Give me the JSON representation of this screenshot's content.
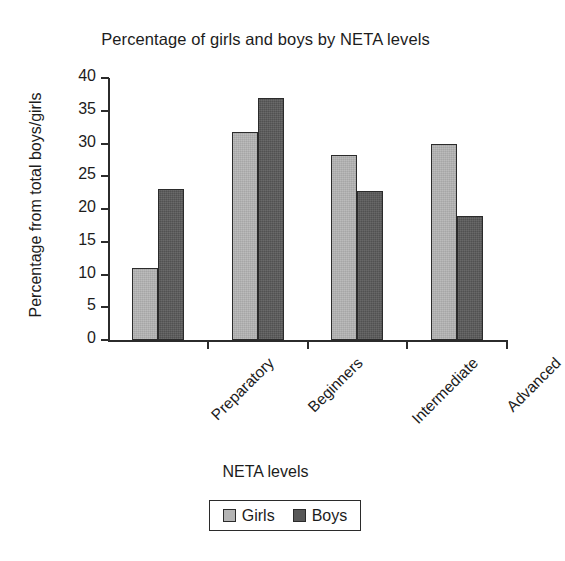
{
  "chart_data": {
    "type": "bar",
    "title": "Percentage of girls and boys by NETA levels",
    "xlabel": "NETA levels",
    "ylabel": "Percentage from total boys/girls",
    "categories": [
      "Preparatory",
      "Beginners",
      "Intermediate",
      "Advanced"
    ],
    "series": [
      {
        "name": "Girls",
        "color": "#b4b4b4",
        "values": [
          11,
          31.7,
          28.3,
          30
        ]
      },
      {
        "name": "Boys",
        "color": "#585858",
        "values": [
          23,
          37,
          22.7,
          19
        ]
      }
    ],
    "ylim": [
      0,
      40
    ],
    "yticks": [
      0,
      5,
      10,
      15,
      20,
      25,
      30,
      35,
      40
    ],
    "ytick_labels": [
      "0",
      "5",
      "10",
      "15",
      "20",
      "25",
      "30",
      "35",
      "40"
    ],
    "grid": false,
    "legend_position": "bottom",
    "legend_entries": [
      "Girls",
      "Boys"
    ]
  }
}
